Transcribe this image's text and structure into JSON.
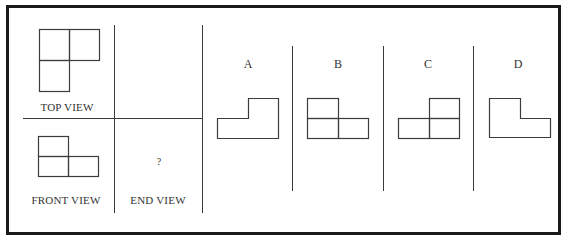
{
  "problem": {
    "views": {
      "top": {
        "label": "TOP VIEW"
      },
      "front": {
        "label": "FRONT VIEW"
      },
      "end": {
        "label": "END VIEW",
        "placeholder": "?"
      }
    },
    "options": [
      {
        "letter": "A",
        "shape": "L-outline-step-up-right"
      },
      {
        "letter": "B",
        "shape": "three-squares-top-left"
      },
      {
        "letter": "C",
        "shape": "three-squares-top-right"
      },
      {
        "letter": "D",
        "shape": "L-outline-step-up-left"
      }
    ]
  },
  "colors": {
    "border": "#1a1a1a",
    "line": "#3c3c3c",
    "background": "#ffffff"
  }
}
